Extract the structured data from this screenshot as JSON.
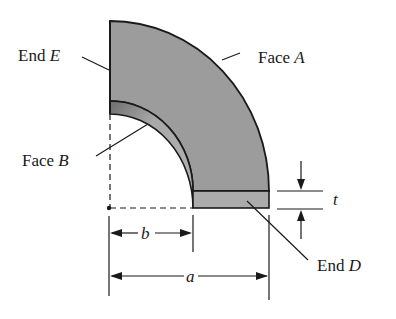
{
  "diagram": {
    "labels": {
      "end_e": {
        "prefix": "End ",
        "letter": "E"
      },
      "face_a": {
        "prefix": "Face ",
        "letter": "A"
      },
      "face_b": {
        "prefix": "Face ",
        "letter": "B"
      },
      "end_d": {
        "prefix": "End ",
        "letter": "D"
      }
    },
    "dimensions": {
      "inner_radius": "b",
      "outer_radius": "a",
      "thickness": "t"
    },
    "colors": {
      "face_fill": "#9a9a9a",
      "inner_face_fill": "#b0b0b0",
      "outline": "#1a1a1a"
    }
  }
}
